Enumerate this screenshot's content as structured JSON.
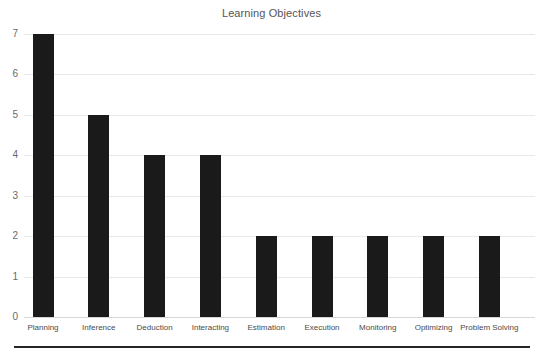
{
  "chart_data": {
    "type": "bar",
    "title": "Learning Objectives",
    "xlabel": "",
    "ylabel": "",
    "ylim": [
      0,
      7
    ],
    "yticks": [
      0,
      1,
      2,
      3,
      4,
      5,
      6,
      7
    ],
    "grid": true,
    "legend": null,
    "bar_color": "#1a1a1a",
    "grid_color": "#e8e8e8",
    "title_color": "#555555",
    "label_color": "#4a4a4a",
    "categories": [
      "Planning",
      "Inference",
      "Deduction",
      "Interacting",
      "Estimation",
      "Execution",
      "Monitoring",
      "Optimizing",
      "Problem Solving"
    ],
    "values": [
      7,
      5,
      4,
      4,
      2,
      2,
      2,
      2,
      2
    ]
  }
}
